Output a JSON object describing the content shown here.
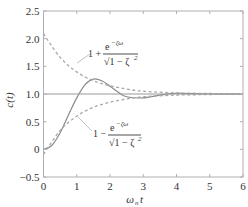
{
  "chart_data": {
    "type": "line",
    "title": "",
    "xlabel": "ω_n t",
    "ylabel": "c(t)",
    "xlim": [
      0,
      6
    ],
    "ylim": [
      -0.5,
      2.5
    ],
    "x_ticks": [
      "0",
      "1",
      "2",
      "3",
      "4",
      "5",
      "6"
    ],
    "y_ticks": [
      "-0.5",
      "0",
      "0.5",
      "1.0",
      "1.5",
      "2.0",
      "2.5"
    ],
    "grid": false,
    "legend": null,
    "series": [
      {
        "name": "c(t) step response",
        "style": "solid",
        "x": [
          0,
          0.25,
          0.5,
          0.75,
          1.0,
          1.25,
          1.5,
          1.75,
          2.0,
          2.25,
          2.5,
          3.0,
          3.5,
          4.0,
          5.0,
          6.0
        ],
        "values": [
          0,
          0.07,
          0.3,
          0.62,
          0.93,
          1.17,
          1.27,
          1.24,
          1.14,
          1.03,
          0.95,
          0.93,
          0.98,
          1.01,
          1.0,
          1.0
        ]
      },
      {
        "name": "upper envelope 1 + e^{-ζω_n t}/√(1-ζ²)",
        "style": "dashed",
        "x": [
          0,
          0.5,
          1.0,
          1.5,
          2.0,
          2.5,
          3.0,
          4.0,
          5.0,
          6.0
        ],
        "values": [
          2.09,
          1.66,
          1.4,
          1.24,
          1.15,
          1.09,
          1.05,
          1.02,
          1.01,
          1.0
        ]
      },
      {
        "name": "lower envelope 1 - e^{-ζω_n t}/√(1-ζ²)",
        "style": "dashed",
        "x": [
          0,
          0.5,
          1.0,
          1.5,
          2.0,
          2.5,
          3.0,
          4.0,
          5.0,
          6.0
        ],
        "values": [
          -0.09,
          0.34,
          0.6,
          0.76,
          0.85,
          0.91,
          0.95,
          0.98,
          0.99,
          1.0
        ]
      },
      {
        "name": "steady-state reference",
        "style": "solid",
        "x": [
          0,
          6
        ],
        "values": [
          1.0,
          1.0
        ]
      }
    ],
    "annotations": [
      {
        "text": "1 + e^{-ζω_n t} / √(1 − ζ²)",
        "points_to": "upper envelope"
      },
      {
        "text": "1 − e^{-ζω_n t} / √(1 − ζ²)",
        "points_to": "lower envelope"
      }
    ]
  },
  "labels": {
    "xlabel_main": "ω",
    "xlabel_sub": "n",
    "xlabel_t": "t",
    "ylabel": "c(t)",
    "upper_prefix": "1 +",
    "lower_prefix": "1 −",
    "numerator": "e",
    "exponent": "−ζω",
    "exponent_sub": "n",
    "exponent_t": "t",
    "denominator": "√1 − ζ",
    "denominator_sq": "2"
  },
  "colors": {
    "axis": "#b0b0b0",
    "curve": "#8a8a8a",
    "envelope": "#a8a8a8",
    "reference": "#9a9a9a",
    "text": "#333333"
  }
}
